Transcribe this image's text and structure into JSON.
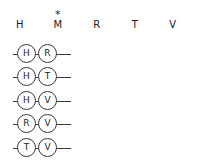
{
  "diagram": {
    "columns": [
      {
        "label": "H",
        "marker": ""
      },
      {
        "label": "M",
        "marker": "*"
      },
      {
        "label": "R",
        "marker": ""
      },
      {
        "label": "T",
        "marker": ""
      },
      {
        "label": "V",
        "marker": ""
      }
    ],
    "rows": [
      {
        "first": "H",
        "second": "R"
      },
      {
        "first": "H",
        "second": "T"
      },
      {
        "first": "H",
        "second": "V"
      },
      {
        "first": "R",
        "second": "V"
      },
      {
        "first": "T",
        "second": "V"
      }
    ],
    "colors": {
      "stroke": "#3a3a3a",
      "text": "#1c1c1c",
      "background": "#ffffff"
    }
  }
}
